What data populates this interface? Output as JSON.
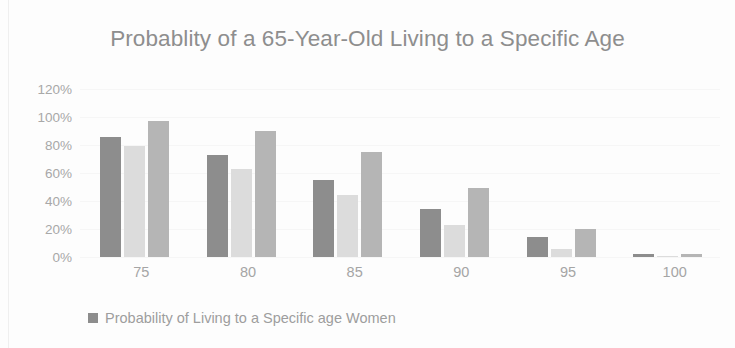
{
  "chart_data": {
    "type": "bar",
    "title": "Probablity of a 65-Year-Old Living to a Specific Age",
    "xlabel": "",
    "ylabel": "",
    "ylim": [
      0,
      120
    ],
    "ytick_labels": [
      "120%",
      "100%",
      "80%",
      "60%",
      "40%",
      "20%",
      "0%"
    ],
    "ytick_values": [
      120,
      100,
      80,
      60,
      40,
      20,
      0
    ],
    "grid": true,
    "legend_position": "bottom-left",
    "categories": [
      "75",
      "80",
      "85",
      "90",
      "95",
      "100"
    ],
    "series": [
      {
        "name": "Probability of Living to a Specific age Women",
        "color": "#8d8d8d",
        "values": [
          86,
          73,
          55,
          34,
          14,
          2
        ]
      },
      {
        "name": "Series 2",
        "color": "#dcdcdc",
        "values": [
          79,
          63,
          44,
          23,
          6,
          1
        ]
      },
      {
        "name": "Series 3",
        "color": "#b5b5b5",
        "values": [
          97,
          90,
          75,
          49,
          20,
          2
        ]
      }
    ],
    "legend": [
      {
        "label": "Probability of Living to a Specific age Women",
        "color": "#8d8d8d"
      }
    ]
  }
}
